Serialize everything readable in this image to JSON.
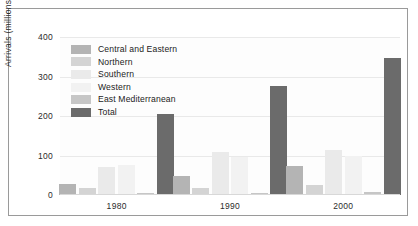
{
  "chart_data": {
    "type": "bar",
    "title": "",
    "xlabel": "",
    "ylabel": "Arrivals (millions)",
    "categories": [
      "1980",
      "1990",
      "2000"
    ],
    "ylim": [
      0,
      400
    ],
    "yticks": [
      0,
      100,
      200,
      300,
      400
    ],
    "grid": true,
    "legend_position": "upper-left-inside",
    "series": [
      {
        "name": "Central and Eastern",
        "color": "#b4b4b4",
        "values": [
          27,
          47,
          73
        ]
      },
      {
        "name": "Northern",
        "color": "#d4d4d4",
        "values": [
          18,
          18,
          25
        ]
      },
      {
        "name": "Southern",
        "color": "#eaeaea",
        "values": [
          70,
          108,
          113
        ]
      },
      {
        "name": "Western",
        "color": "#f2f2f2",
        "values": [
          77,
          95,
          100
        ]
      },
      {
        "name": "East Mediterranean",
        "color": "#c6c6c6",
        "values": [
          5,
          5,
          7
        ]
      },
      {
        "name": "Total",
        "color": "#6b6b6b",
        "values": [
          205,
          277,
          347
        ]
      }
    ]
  },
  "axis": {
    "y_tick_labels": [
      "400",
      "300",
      "200",
      "100",
      "0"
    ],
    "y_label": "Arrivals (millions)",
    "x_tick_labels": [
      "1980",
      "1990",
      "2000"
    ]
  },
  "legend": {
    "items": [
      {
        "label": "Central and Eastern",
        "color": "#b4b4b4"
      },
      {
        "label": "Northern",
        "color": "#d4d4d4"
      },
      {
        "label": "Southern",
        "color": "#eaeaea"
      },
      {
        "label": "Western",
        "color": "#f2f2f2"
      },
      {
        "label": "East Mediterranean",
        "color": "#c6c6c6"
      },
      {
        "label": "Total",
        "color": "#6b6b6b"
      }
    ]
  },
  "colors": {
    "frame_border": "#9a9a9a",
    "gridline": "#e9e9e9",
    "text": "#2b2b2b",
    "background": "#ffffff"
  }
}
